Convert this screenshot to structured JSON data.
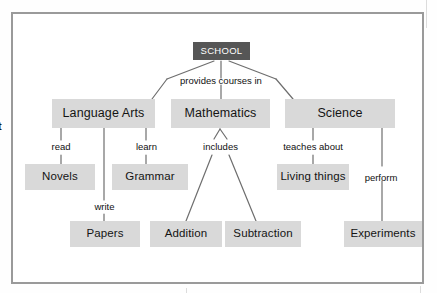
{
  "diagram": {
    "colors": {
      "root_fill": "#565656",
      "root_text": "#ffffff",
      "node_fill": "#d9d9d9",
      "node_text": "#141414",
      "link_stroke": "#6e6e6e",
      "frame_stroke": "#9a9a9a",
      "page_background": "#ffffff"
    },
    "root": {
      "label": "SCHOOL"
    },
    "level1": [
      {
        "label": "Language Arts"
      },
      {
        "label": "Mathematics"
      },
      {
        "label": "Science"
      }
    ],
    "level2": [
      {
        "label": "Novels"
      },
      {
        "label": "Grammar"
      },
      {
        "label": "Living things"
      }
    ],
    "level3": [
      {
        "label": "Papers"
      },
      {
        "label": "Addition"
      },
      {
        "label": "Subtraction"
      },
      {
        "label": "Experiments"
      }
    ],
    "link_labels": [
      {
        "label": "provides courses in"
      },
      {
        "label": "read"
      },
      {
        "label": "learn"
      },
      {
        "label": "includes"
      },
      {
        "label": "teaches about"
      },
      {
        "label": "write"
      },
      {
        "label": "perform"
      }
    ],
    "margin_text": "t"
  }
}
